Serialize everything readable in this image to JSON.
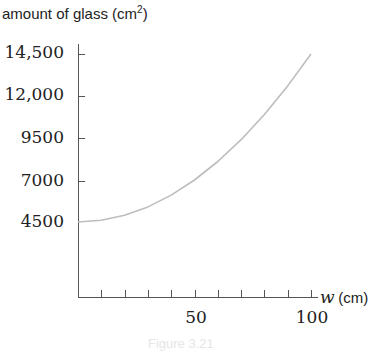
{
  "chart_data": {
    "type": "line",
    "title": "",
    "ylabel": "amount of glass (cm²)",
    "ylabel_text": "amount of glass (cm",
    "ylabel_sup": "2",
    "ylabel_close": ")",
    "xlabel_var": "w",
    "xlabel_unit": "(cm)",
    "x_ticks": [
      10,
      20,
      30,
      40,
      50,
      60,
      70,
      80,
      90,
      100
    ],
    "x_tick_labels": [
      "50",
      "100"
    ],
    "y_tick_labels": [
      "14,500",
      "12,000",
      "9500",
      "7000",
      "4500"
    ],
    "y_ticks": [
      14500,
      12000,
      9500,
      7000,
      4500
    ],
    "xlim": [
      0,
      100
    ],
    "ylim": [
      0,
      14500
    ],
    "grid": false,
    "series": [
      {
        "name": "amount of glass",
        "x": [
          0,
          10,
          20,
          30,
          40,
          50,
          60,
          70,
          80,
          90,
          100
        ],
        "y": [
          4500,
          4600,
          4900,
          5400,
          6100,
          7000,
          8100,
          9400,
          10900,
          12600,
          14500
        ]
      }
    ],
    "curve_color": "#bdbdbd",
    "caption": "Figure 3.21"
  }
}
